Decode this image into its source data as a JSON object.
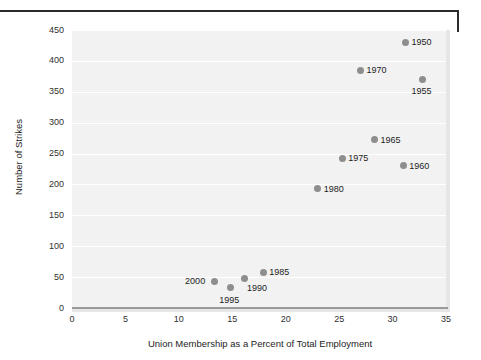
{
  "chart_data": {
    "type": "scatter",
    "title": "",
    "xlabel": "Union Membership as a Percent of Total Employment",
    "ylabel": "Number of Strikes",
    "xlim": [
      0,
      35
    ],
    "ylim": [
      0,
      450
    ],
    "xticks": [
      "0",
      "5",
      "10",
      "15",
      "20",
      "25",
      "30",
      "35"
    ],
    "yticks": [
      "0",
      "50",
      "100",
      "150",
      "200",
      "250",
      "300",
      "350",
      "400",
      "450"
    ],
    "grid": "horizontal",
    "legend": "none",
    "point_color": "#8e8e8e",
    "plot_background": "#f2f2f2",
    "points": [
      {
        "label": "1950",
        "x": 31.2,
        "y": 430,
        "label_pos": "right"
      },
      {
        "label": "1955",
        "x": 32.8,
        "y": 370,
        "label_pos": "below"
      },
      {
        "label": "1960",
        "x": 31.0,
        "y": 230,
        "label_pos": "right"
      },
      {
        "label": "1965",
        "x": 28.3,
        "y": 272,
        "label_pos": "right"
      },
      {
        "label": "1970",
        "x": 27.0,
        "y": 385,
        "label_pos": "right"
      },
      {
        "label": "1975",
        "x": 25.3,
        "y": 242,
        "label_pos": "right"
      },
      {
        "label": "1980",
        "x": 23.0,
        "y": 193,
        "label_pos": "right"
      },
      {
        "label": "1985",
        "x": 17.9,
        "y": 58,
        "label_pos": "right"
      },
      {
        "label": "1990",
        "x": 16.1,
        "y": 47,
        "label_pos": "below-right"
      },
      {
        "label": "1995",
        "x": 14.8,
        "y": 33,
        "label_pos": "below"
      },
      {
        "label": "2000",
        "x": 13.3,
        "y": 43,
        "label_pos": "left"
      }
    ]
  }
}
